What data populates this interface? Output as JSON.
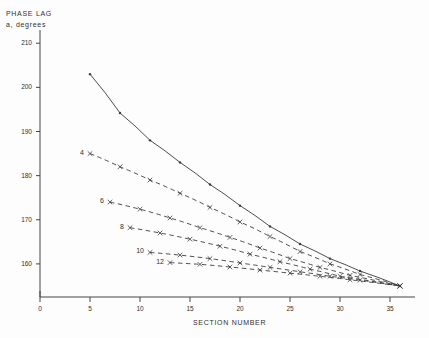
{
  "chart_data": {
    "type": "line",
    "title": "",
    "ylabel_line1": "PHASE  LAG",
    "ylabel_line2": "a,  degrees",
    "xlabel": "SECTION  NUMBER",
    "xlim": [
      0,
      37.5
    ],
    "ylim": [
      152.5,
      213
    ],
    "xticks": [
      0,
      5,
      10,
      15,
      20,
      25,
      30,
      35
    ],
    "yticks": [
      160,
      170,
      180,
      190,
      200,
      210
    ],
    "grid": false,
    "legend_position": "inline-left-labels",
    "series": [
      {
        "name": "",
        "label": "",
        "style": "solid",
        "marker": "dot",
        "x": [
          5,
          8,
          11,
          14,
          17,
          20,
          23,
          26,
          29,
          32,
          36
        ],
        "y": [
          203.0,
          194.2,
          188.0,
          183.0,
          178.0,
          173.2,
          168.5,
          164.5,
          161.2,
          158.4,
          155.0
        ]
      },
      {
        "name": "4",
        "label": "4",
        "style": "dashed",
        "marker": "x",
        "x": [
          5,
          8,
          11,
          14,
          17,
          20,
          23,
          26,
          29,
          32,
          36
        ],
        "y": [
          185.0,
          182.0,
          179.0,
          176.0,
          172.8,
          169.5,
          166.2,
          162.8,
          160.0,
          157.6,
          155.0
        ]
      },
      {
        "name": "6",
        "label": "6",
        "style": "dashed",
        "marker": "x",
        "x": [
          7,
          10,
          13,
          16,
          19,
          22,
          25,
          28,
          31,
          36
        ],
        "y": [
          174.0,
          172.4,
          170.4,
          168.2,
          166.0,
          163.6,
          161.2,
          159.2,
          157.4,
          155.0
        ]
      },
      {
        "name": "8",
        "label": "8",
        "style": "dashed",
        "marker": "x",
        "x": [
          9,
          12,
          15,
          18,
          21,
          24,
          27,
          30,
          36
        ],
        "y": [
          168.2,
          167.0,
          165.6,
          164.0,
          162.2,
          160.5,
          158.8,
          157.2,
          155.0
        ]
      },
      {
        "name": "10",
        "label": "10",
        "style": "dashed",
        "marker": "x",
        "x": [
          11,
          14,
          17,
          20,
          23,
          26,
          29,
          32,
          36
        ],
        "y": [
          162.6,
          162.0,
          161.2,
          160.2,
          159.2,
          158.2,
          157.2,
          156.3,
          155.0
        ]
      },
      {
        "name": "12",
        "label": "12",
        "style": "dashed",
        "marker": "x",
        "x": [
          13,
          16,
          19,
          22,
          25,
          28,
          31,
          36
        ],
        "y": [
          160.3,
          159.9,
          159.3,
          158.6,
          157.9,
          157.2,
          156.4,
          155.0
        ]
      }
    ],
    "colors": {
      "line": "#3a3a3a",
      "axis": "#444444",
      "text": "#2f2f2f",
      "background": "#fdfdfd"
    }
  }
}
